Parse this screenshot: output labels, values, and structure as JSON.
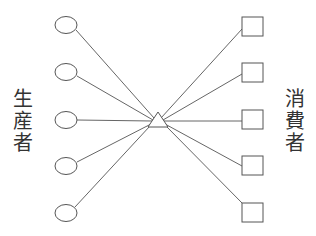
{
  "diagram": {
    "left_label": [
      "生",
      "産",
      "者"
    ],
    "right_label": [
      "消",
      "費",
      "者"
    ],
    "colors": {
      "stroke": "#555555",
      "text": "#333333",
      "background": "#ffffff"
    },
    "producers": [
      {
        "shape": "circle",
        "cx": 66,
        "cy": 25
      },
      {
        "shape": "circle",
        "cx": 66,
        "cy": 72
      },
      {
        "shape": "circle",
        "cx": 66,
        "cy": 120
      },
      {
        "shape": "circle",
        "cx": 66,
        "cy": 166
      },
      {
        "shape": "circle",
        "cx": 66,
        "cy": 213
      }
    ],
    "consumers": [
      {
        "shape": "square",
        "x": 242,
        "y": 17
      },
      {
        "shape": "square",
        "x": 242,
        "y": 63
      },
      {
        "shape": "square",
        "x": 242,
        "y": 110
      },
      {
        "shape": "square",
        "x": 242,
        "y": 156
      },
      {
        "shape": "square",
        "x": 242,
        "y": 203
      }
    ],
    "hub": {
      "shape": "triangle",
      "apex": [
        158,
        112
      ],
      "base_left": [
        148,
        127
      ],
      "base_right": [
        168,
        127
      ]
    }
  }
}
